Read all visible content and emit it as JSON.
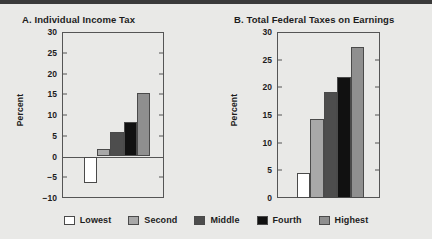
{
  "figure": {
    "background_color": "#e9e9e7",
    "top_rule_color": "#3a3a3a"
  },
  "legend": {
    "position": "bottom-center",
    "items": [
      {
        "label": "Lowest",
        "color": "#ffffff"
      },
      {
        "label": "Second",
        "color": "#a8a8a8"
      },
      {
        "label": "Middle",
        "color": "#4d4d4d"
      },
      {
        "label": "Fourth",
        "color": "#111111"
      },
      {
        "label": "Highest",
        "color": "#8f8f8f"
      }
    ]
  },
  "chart_data": [
    {
      "id": "panel-a",
      "type": "bar",
      "title": "A.  Individual Income Tax",
      "xlabel": "",
      "ylabel": "Percent",
      "ylim": [
        -10,
        30
      ],
      "yticks": [
        30,
        25,
        20,
        15,
        10,
        5,
        0,
        -5,
        -10
      ],
      "ytick_labels": [
        "30",
        "25",
        "20",
        "15",
        "10",
        "5",
        "0",
        "−5",
        "−10"
      ],
      "grid": false,
      "zero_line": true,
      "categories": [
        "Lowest",
        "Second",
        "Middle",
        "Fourth",
        "Highest"
      ],
      "values": [
        -6.5,
        1.7,
        5.9,
        8.2,
        15.2
      ],
      "colors": [
        "#ffffff",
        "#a8a8a8",
        "#4d4d4d",
        "#111111",
        "#8f8f8f"
      ]
    },
    {
      "id": "panel-b",
      "type": "bar",
      "title": "B.  Total Federal Taxes on Earnings",
      "xlabel": "",
      "ylabel": "Percent",
      "ylim": [
        0,
        30
      ],
      "yticks": [
        30,
        25,
        20,
        15,
        10,
        5,
        0
      ],
      "ytick_labels": [
        "30",
        "25",
        "20",
        "15",
        "10",
        "5",
        "0"
      ],
      "grid": false,
      "zero_line": false,
      "categories": [
        "Lowest",
        "Second",
        "Middle",
        "Fourth",
        "Highest"
      ],
      "values": [
        4.6,
        14.3,
        19.2,
        21.9,
        27.3
      ],
      "colors": [
        "#ffffff",
        "#a8a8a8",
        "#4d4d4d",
        "#111111",
        "#8f8f8f"
      ]
    }
  ]
}
